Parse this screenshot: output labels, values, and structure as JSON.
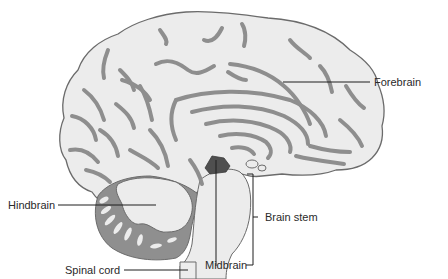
{
  "diagram": {
    "colors": {
      "cortex_fill": "#ececec",
      "sulcus": "#8e8e8e",
      "outline": "#6b6b6b",
      "midbrain": "#4f4f4f",
      "label_text": "#2a2a2a"
    },
    "labels": {
      "forebrain": "Forebrain",
      "hindbrain": "Hindbrain",
      "brain_stem": "Brain stem",
      "midbrain": "Midbrain",
      "spinal_cord": "Spinal cord"
    }
  }
}
